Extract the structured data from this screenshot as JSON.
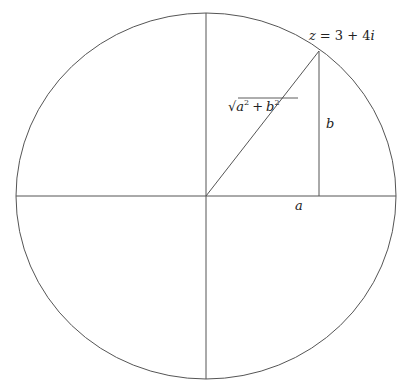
{
  "diagram": {
    "type": "complex-plane-modulus",
    "circle": {
      "cx": 206,
      "cy": 196,
      "rx": 190,
      "ry": 183,
      "stroke": "#555555"
    },
    "axes": {
      "horizontal": {
        "x1": 16,
        "y1": 196,
        "x2": 396,
        "y2": 196
      },
      "vertical": {
        "x1": 206,
        "y1": 13,
        "x2": 206,
        "y2": 379
      }
    },
    "point": {
      "x": 319,
      "y": 51
    },
    "stroke_color": "#555555",
    "labels": {
      "point": {
        "var": "z",
        "eq": "=",
        "value": "3 + 4",
        "imag": "i"
      },
      "hypotenuse": {
        "radical": "√",
        "a": "a",
        "a_exp": "2",
        "plus": "+",
        "b": "b",
        "b_exp": "2"
      },
      "vertical_leg": "b",
      "horizontal_leg": "a"
    }
  }
}
